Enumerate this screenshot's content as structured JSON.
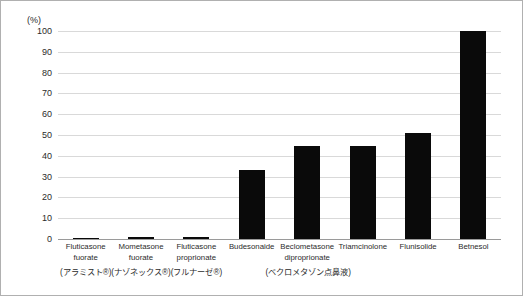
{
  "chart_data": {
    "type": "bar",
    "title": "",
    "subtitle": "",
    "xlabel": "",
    "ylabel": "",
    "unit_label": "(%)",
    "ylim": [
      0,
      100
    ],
    "ytick_step": 10,
    "grid": true,
    "legend": false,
    "legend_position": "none",
    "bar_color": "#0a0a0a",
    "gridline_color": "#d9d9d9",
    "categories": [
      "Fluticasone fuorate",
      "Mometasone fuorate",
      "Fluticasone proprionate",
      "Budesonaide",
      "Beclometasone diproprionate",
      "Triamcinolone",
      "Flunisolide",
      "Betnesol"
    ],
    "category_lines": [
      [
        "Fluticasone",
        "fuorate"
      ],
      [
        "Mometasone",
        "fuorate"
      ],
      [
        "Fluticasone",
        "proprionate"
      ],
      [
        "Budesonaide"
      ],
      [
        "Beclometasone",
        "diproprionate"
      ],
      [
        "Triamcinolone"
      ],
      [
        "Flunisolide"
      ],
      [
        "Betnesol"
      ]
    ],
    "values": [
      0.6,
      0.8,
      0.8,
      33,
      44.5,
      44.5,
      51,
      100
    ],
    "yticks": [
      "100",
      "90",
      "80",
      "70",
      "60",
      "50",
      "40",
      "30",
      "20",
      "10",
      "0"
    ],
    "annotations": [
      {
        "text": "(アラミスト®)",
        "for_category": "Fluticasone fuorate",
        "center_pct": 6.25
      },
      {
        "text": "(ナゾネックス®)",
        "for_category": "Mometasone fuorate",
        "center_pct": 18.75
      },
      {
        "text": "(フルナーゼ®)",
        "for_category": "Fluticasone proprionate",
        "center_pct": 31.25
      },
      {
        "text": "(ベクロメタゾン点鼻液)",
        "for_category": "Beclometasone diproprionate",
        "center_pct": 56.5
      }
    ]
  }
}
